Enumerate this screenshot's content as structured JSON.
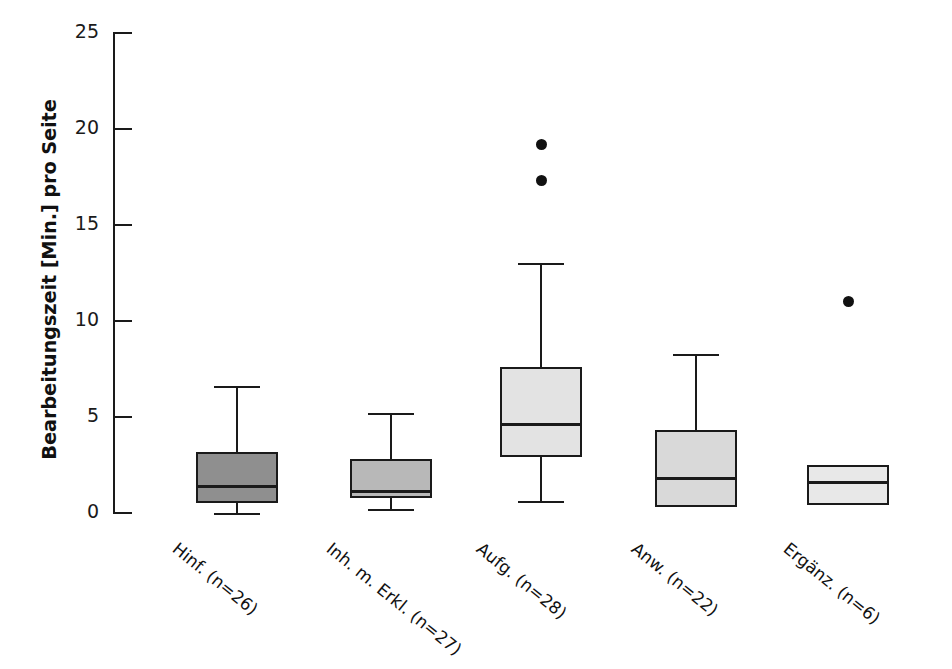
{
  "chart_data": {
    "type": "box",
    "title": "",
    "xlabel": "",
    "ylabel": "Bearbeitungszeit [Min.] pro Seite",
    "ylim": [
      0,
      25
    ],
    "ytick_values": [
      0,
      5,
      10,
      15,
      20,
      25
    ],
    "ytick_labels": [
      "0",
      "5",
      "10",
      "15",
      "20",
      "25"
    ],
    "grid": false,
    "legend": "none",
    "categories": [
      "Hinf. (n=26)",
      "Inh. m. Erkl. (n=27)",
      "Aufg. (n=28)",
      "Anw. (n=22)",
      "Ergänz. (n=6)"
    ],
    "boxes": [
      {
        "category": "Hinf. (n=26)",
        "n": 26,
        "whisker_low": 0.0,
        "q1": 0.5,
        "median": 1.4,
        "q3": 3.2,
        "whisker_high": 6.6,
        "outliers": [],
        "fill": "#8f8f8f"
      },
      {
        "category": "Inh. m. Erkl. (n=27)",
        "n": 27,
        "whisker_low": 0.2,
        "q1": 0.8,
        "median": 1.1,
        "q3": 2.8,
        "whisker_high": 5.2,
        "outliers": [],
        "fill": "#b8b8b8"
      },
      {
        "category": "Aufg. (n=28)",
        "n": 28,
        "whisker_low": 0.6,
        "q1": 2.9,
        "median": 4.6,
        "q3": 7.6,
        "whisker_high": 13.0,
        "outliers": [
          19.2,
          17.3
        ],
        "fill": "#e3e3e3"
      },
      {
        "category": "Anw. (n=22)",
        "n": 22,
        "whisker_low": 0.3,
        "q1": 0.3,
        "median": 1.8,
        "q3": 4.3,
        "whisker_high": 8.3,
        "outliers": [],
        "fill": "#d9d9d9"
      },
      {
        "category": "Ergänz. (n=6)",
        "n": 6,
        "whisker_low": 0.4,
        "q1": 0.4,
        "median": 1.6,
        "q3": 2.5,
        "whisker_high": 2.5,
        "outliers": [
          11.0
        ],
        "fill": "#e8e8e8"
      }
    ]
  },
  "colors": {
    "axis": "#1a1a1a",
    "outlier": "#111111",
    "background": "#ffffff"
  }
}
